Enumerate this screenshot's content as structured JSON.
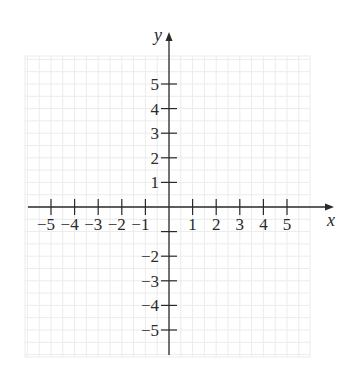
{
  "chart_data": {
    "type": "coordinate-plane",
    "title": "",
    "xlabel": "x",
    "ylabel": "y",
    "xlim": [
      -5,
      5
    ],
    "ylim": [
      -5,
      5
    ],
    "grid": true,
    "grid_step": 0.5,
    "x_ticks": [
      -5,
      -4,
      -3,
      -2,
      -1,
      1,
      2,
      3,
      4,
      5
    ],
    "x_tick_labels": [
      "−5",
      "−4",
      "−3",
      "−2",
      "−1",
      "1",
      "2",
      "3",
      "4",
      "5"
    ],
    "y_ticks": [
      5,
      4,
      3,
      2,
      1,
      -1,
      -2,
      -3,
      -4,
      -5
    ],
    "y_tick_labels": [
      "5",
      "4",
      "3",
      "2",
      "1",
      "",
      "−2",
      "−3",
      "−4",
      "−5"
    ],
    "series": []
  },
  "colors": {
    "axis": "#2a2a2a",
    "grid": "#ececec",
    "background": "#ffffff"
  }
}
